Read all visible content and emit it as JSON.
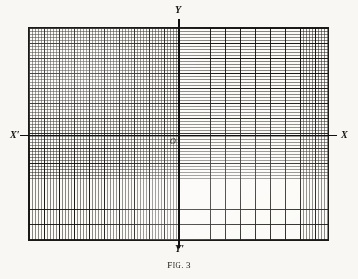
{
  "figure": {
    "caption_lead": "F",
    "caption_smallcaps": "IG",
    "caption_separator": ".",
    "caption_number": "3",
    "caption_full": "FIG. 3"
  },
  "axes": {
    "x_negative_label": "X′",
    "x_positive_label": "X",
    "y_positive_label": "Y",
    "y_negative_label": "Y′",
    "origin_label": "O"
  },
  "chart_data": {
    "type": "line",
    "subtitle": "",
    "xlabel": "X",
    "ylabel": "Y",
    "grid": true,
    "grid_fine_spacing_px": 3,
    "grid_major_every_n_fine": 5,
    "grid_columns_fine": 100,
    "grid_rows_fine": 71,
    "axis_origin_px": {
      "x": 179,
      "y": 135
    },
    "plot_area_px": {
      "left": 28,
      "top": 27,
      "width": 301,
      "height": 214
    },
    "legend": [],
    "series": [],
    "categories": [],
    "annotations": [
      {
        "text": "X′",
        "position": "left-axis-end"
      },
      {
        "text": "X",
        "position": "right-axis-end"
      },
      {
        "text": "Y",
        "position": "top-axis-end"
      },
      {
        "text": "Y′",
        "position": "bottom-axis-end"
      },
      {
        "text": "O",
        "position": "origin"
      }
    ],
    "colors": {
      "paper": "#f8f7f3",
      "grid_fine": "#282622",
      "grid_major": "#12110f",
      "axis": "#111010",
      "text": "#16150f"
    }
  }
}
